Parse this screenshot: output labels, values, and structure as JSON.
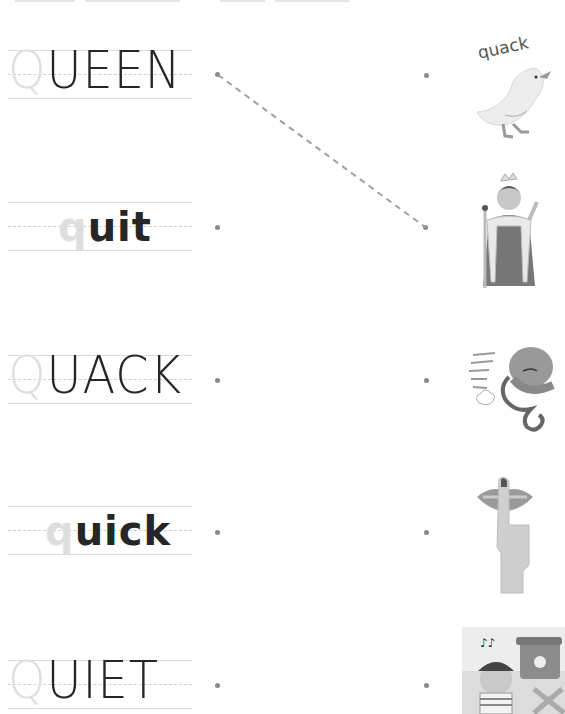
{
  "worksheet": {
    "rows": [
      {
        "ghost_letter": "Q",
        "rest": "UEEN",
        "case": "upper"
      },
      {
        "ghost_letter": "q",
        "rest": "uit",
        "case": "lower"
      },
      {
        "ghost_letter": "Q",
        "rest": "UACK",
        "case": "upper"
      },
      {
        "ghost_letter": "q",
        "rest": "uick",
        "case": "lower"
      },
      {
        "ghost_letter": "Q",
        "rest": "UIET",
        "case": "upper"
      }
    ],
    "pictures": [
      {
        "subject": "duck",
        "caption": "quack"
      },
      {
        "subject": "queen"
      },
      {
        "subject": "octopus"
      },
      {
        "subject": "finger-on-lips"
      },
      {
        "subject": "boy-eating-near-trash-can"
      }
    ],
    "connection": {
      "from_word": "QUEEN",
      "to_picture": "queen"
    },
    "colors": {
      "ink": "#262626",
      "ghost": "#dedede",
      "dot": "#8a8a8a",
      "line": "#a0a0a0"
    }
  }
}
